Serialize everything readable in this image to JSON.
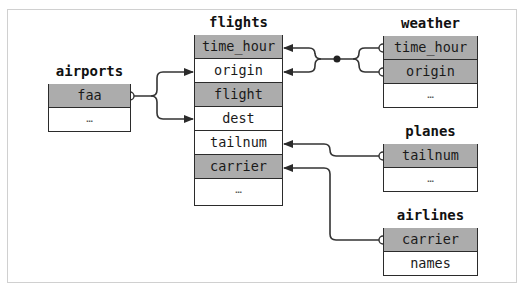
{
  "diagram": {
    "tables": [
      {
        "id": "flights",
        "title": "flights",
        "rows": [
          {
            "label": "time_hour",
            "key": true
          },
          {
            "label": "origin",
            "key": false
          },
          {
            "label": "flight",
            "key": true
          },
          {
            "label": "dest",
            "key": false
          },
          {
            "label": "tailnum",
            "key": false
          },
          {
            "label": "carrier",
            "key": true
          },
          {
            "label": "…",
            "key": false
          }
        ]
      },
      {
        "id": "airports",
        "title": "airports",
        "rows": [
          {
            "label": "faa",
            "key": true
          },
          {
            "label": "…",
            "key": false
          }
        ]
      },
      {
        "id": "weather",
        "title": "weather",
        "rows": [
          {
            "label": "time_hour",
            "key": true
          },
          {
            "label": "origin",
            "key": true
          },
          {
            "label": "…",
            "key": false
          }
        ]
      },
      {
        "id": "planes",
        "title": "planes",
        "rows": [
          {
            "label": "tailnum",
            "key": true
          },
          {
            "label": "…",
            "key": false
          }
        ]
      },
      {
        "id": "airlines",
        "title": "airlines",
        "rows": [
          {
            "label": "carrier",
            "key": true
          },
          {
            "label": "names",
            "key": false
          }
        ]
      }
    ],
    "relations": [
      {
        "from": "airports.faa",
        "to": [
          "flights.origin",
          "flights.dest"
        ]
      },
      {
        "from": [
          "weather.time_hour",
          "weather.origin"
        ],
        "to": [
          "flights.time_hour",
          "flights.origin"
        ]
      },
      {
        "from": "planes.tailnum",
        "to": "flights.tailnum"
      },
      {
        "from": "airlines.carrier",
        "to": "flights.carrier"
      }
    ],
    "colors": {
      "key_fill": "#acacac",
      "border": "#2b2b2b",
      "line": "#333333",
      "frame": "#d0d0d0"
    }
  }
}
